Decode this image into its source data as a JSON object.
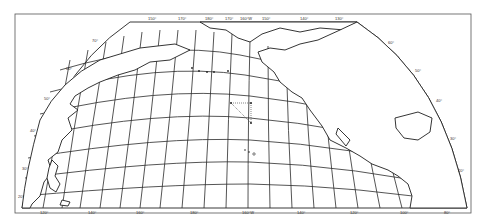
{
  "map": {
    "type": "oblique projection graticule map",
    "region": "North Pacific Ocean",
    "colors": {
      "ink": "#2a2a2a",
      "paper": "#ffffff",
      "frame": "#555555"
    },
    "top_labels": [
      "150°",
      "170°",
      "180°",
      "170°",
      "160°W",
      "150°",
      "140°",
      "130°"
    ],
    "bottom_labels": [
      "120°",
      "140°",
      "160°",
      "180°",
      "160°W",
      "140°",
      "120°",
      "100°",
      "80°"
    ],
    "left_arc_labels": [
      "70°",
      "60°",
      "50°",
      "40°",
      "30°",
      "20°"
    ],
    "right_arc_labels": [
      "60°",
      "50°",
      "40°",
      "30°",
      "20°"
    ],
    "features": [
      {
        "name": "Alaska / Bering Strait coast",
        "kind": "coastline"
      },
      {
        "name": "Kamchatka / East Asia coast",
        "kind": "coastline"
      },
      {
        "name": "Japan",
        "kind": "coastline"
      },
      {
        "name": "Aleutian Islands",
        "kind": "island-chain"
      },
      {
        "name": "Hawaiian Islands",
        "kind": "island-chain"
      },
      {
        "name": "Midway triangle markers",
        "kind": "route"
      },
      {
        "name": "North American west coast",
        "kind": "coastline"
      },
      {
        "name": "Gulf of Mexico",
        "kind": "water"
      },
      {
        "name": "Central America",
        "kind": "coastline"
      }
    ]
  }
}
